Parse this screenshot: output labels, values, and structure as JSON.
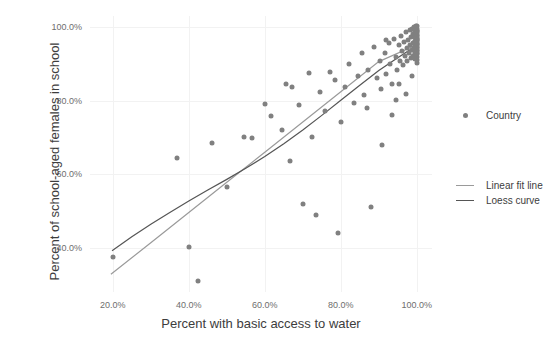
{
  "chart_data": {
    "type": "scatter",
    "title": "",
    "xlabel": "Percent with basic access to water",
    "ylabel": "Percent of school-aged females in school",
    "xlim": [
      0.14,
      1.04
    ],
    "ylim": [
      0.28,
      1.03
    ],
    "grid": true,
    "xticks": [
      "20.0%",
      "40.0%",
      "60.0%",
      "80.0%",
      "100.0%"
    ],
    "xtick_values": [
      0.2,
      0.4,
      0.6,
      0.8,
      1.0
    ],
    "yticks": [
      "40.0%",
      "60.0%",
      "80.0%",
      "100.0%"
    ],
    "ytick_values": [
      0.4,
      0.6,
      0.8,
      1.0
    ],
    "legend_position": "right",
    "legend": [
      {
        "label": "Country",
        "type": "point",
        "color": "#808080"
      },
      {
        "label": "Linear fit line",
        "type": "line",
        "color": "#9a9a9a"
      },
      {
        "label": "Loess curve",
        "type": "line",
        "color": "#555555"
      }
    ],
    "series": [
      {
        "name": "Country",
        "type": "scatter",
        "color": "#808080",
        "points": [
          [
            0.2,
            0.375
          ],
          [
            0.37,
            0.645
          ],
          [
            0.4,
            0.402
          ],
          [
            0.425,
            0.309
          ],
          [
            0.46,
            0.686
          ],
          [
            0.5,
            0.566
          ],
          [
            0.545,
            0.7
          ],
          [
            0.565,
            0.698
          ],
          [
            0.6,
            0.79
          ],
          [
            0.615,
            0.758
          ],
          [
            0.645,
            0.721
          ],
          [
            0.655,
            0.846
          ],
          [
            0.665,
            0.636
          ],
          [
            0.672,
            0.836
          ],
          [
            0.69,
            0.788
          ],
          [
            0.7,
            0.518
          ],
          [
            0.715,
            0.876
          ],
          [
            0.724,
            0.7
          ],
          [
            0.735,
            0.489
          ],
          [
            0.745,
            0.824
          ],
          [
            0.758,
            0.772
          ],
          [
            0.772,
            0.878
          ],
          [
            0.785,
            0.855
          ],
          [
            0.792,
            0.44
          ],
          [
            0.8,
            0.742
          ],
          [
            0.812,
            0.836
          ],
          [
            0.822,
            0.9
          ],
          [
            0.835,
            0.793
          ],
          [
            0.845,
            0.866
          ],
          [
            0.855,
            0.93
          ],
          [
            0.862,
            0.816
          ],
          [
            0.872,
            0.884
          ],
          [
            0.88,
            0.512
          ],
          [
            0.888,
            0.946
          ],
          [
            0.894,
            0.862
          ],
          [
            0.902,
            0.908
          ],
          [
            0.908,
            0.68
          ],
          [
            0.915,
            0.93
          ],
          [
            0.92,
            0.872
          ],
          [
            0.926,
            0.956
          ],
          [
            0.93,
            0.9
          ],
          [
            0.936,
            0.844
          ],
          [
            0.94,
            0.968
          ],
          [
            0.944,
            0.918
          ],
          [
            0.948,
            0.884
          ],
          [
            0.952,
            0.952
          ],
          [
            0.955,
            0.908
          ],
          [
            0.958,
            0.976
          ],
          [
            0.961,
            0.934
          ],
          [
            0.964,
            0.896
          ],
          [
            0.967,
            0.958
          ],
          [
            0.969,
            0.922
          ],
          [
            0.971,
            0.986
          ],
          [
            0.973,
            0.944
          ],
          [
            0.975,
            0.908
          ],
          [
            0.977,
            0.966
          ],
          [
            0.979,
            0.93
          ],
          [
            0.981,
            0.992
          ],
          [
            0.982,
            0.95
          ],
          [
            0.984,
            0.916
          ],
          [
            0.985,
            0.974
          ],
          [
            0.987,
            0.938
          ],
          [
            0.988,
            0.996
          ],
          [
            0.989,
            0.956
          ],
          [
            0.99,
            0.922
          ],
          [
            0.991,
            0.98
          ],
          [
            0.992,
            0.944
          ],
          [
            0.993,
            1.0
          ],
          [
            0.994,
            0.962
          ],
          [
            0.9945,
            0.93
          ],
          [
            0.995,
            0.986
          ],
          [
            0.9955,
            0.95
          ],
          [
            0.996,
            0.912
          ],
          [
            0.9965,
            0.972
          ],
          [
            0.997,
            0.936
          ],
          [
            0.9975,
            0.998
          ],
          [
            0.998,
            0.958
          ],
          [
            0.9983,
            0.924
          ],
          [
            0.9986,
            0.982
          ],
          [
            0.9989,
            0.946
          ],
          [
            0.9992,
            1.002
          ],
          [
            0.9994,
            0.968
          ],
          [
            0.9996,
            0.934
          ],
          [
            0.9997,
            0.99
          ],
          [
            0.9998,
            0.954
          ],
          [
            0.99985,
            0.918
          ],
          [
            0.9999,
            0.976
          ],
          [
            0.99993,
            0.942
          ],
          [
            0.99995,
            1.004
          ],
          [
            0.99996,
            0.962
          ],
          [
            0.99997,
            0.928
          ],
          [
            0.99998,
            0.984
          ],
          [
            1.0,
            0.95
          ],
          [
            1.0,
            0.994
          ],
          [
            1.0,
            0.966
          ],
          [
            1.0,
            0.938
          ],
          [
            1.0,
            0.978
          ],
          [
            1.0,
            0.956
          ],
          [
            1.0,
            0.91
          ],
          [
            1.0,
            0.988
          ],
          [
            1.0,
            0.93
          ],
          [
            1.0,
            0.97
          ],
          [
            1.0,
            0.946
          ],
          [
            1.0,
            0.902
          ],
          [
            0.953,
            0.846
          ],
          [
            0.906,
            0.832
          ],
          [
            0.868,
            0.78
          ],
          [
            0.935,
            0.76
          ],
          [
            0.972,
            0.818
          ],
          [
            0.988,
            0.868
          ],
          [
            0.944,
            0.802
          ],
          [
            0.918,
            0.964
          ]
        ]
      },
      {
        "name": "Linear fit line",
        "type": "line",
        "color": "#9a9a9a",
        "points": [
          [
            0.195,
            0.328
          ],
          [
            0.3,
            0.414
          ],
          [
            0.4,
            0.496
          ],
          [
            0.5,
            0.578
          ],
          [
            0.6,
            0.66
          ],
          [
            0.7,
            0.742
          ],
          [
            0.8,
            0.824
          ],
          [
            0.9,
            0.906
          ],
          [
            1.0,
            0.952
          ]
        ]
      },
      {
        "name": "Loess curve",
        "type": "line",
        "color": "#555555",
        "points": [
          [
            0.198,
            0.392
          ],
          [
            0.25,
            0.43
          ],
          [
            0.3,
            0.464
          ],
          [
            0.35,
            0.496
          ],
          [
            0.4,
            0.527
          ],
          [
            0.45,
            0.557
          ],
          [
            0.5,
            0.586
          ],
          [
            0.55,
            0.616
          ],
          [
            0.6,
            0.648
          ],
          [
            0.65,
            0.683
          ],
          [
            0.7,
            0.72
          ],
          [
            0.75,
            0.76
          ],
          [
            0.8,
            0.801
          ],
          [
            0.85,
            0.842
          ],
          [
            0.9,
            0.882
          ],
          [
            0.94,
            0.91
          ],
          [
            0.97,
            0.93
          ],
          [
            1.0,
            0.95
          ]
        ]
      }
    ]
  }
}
